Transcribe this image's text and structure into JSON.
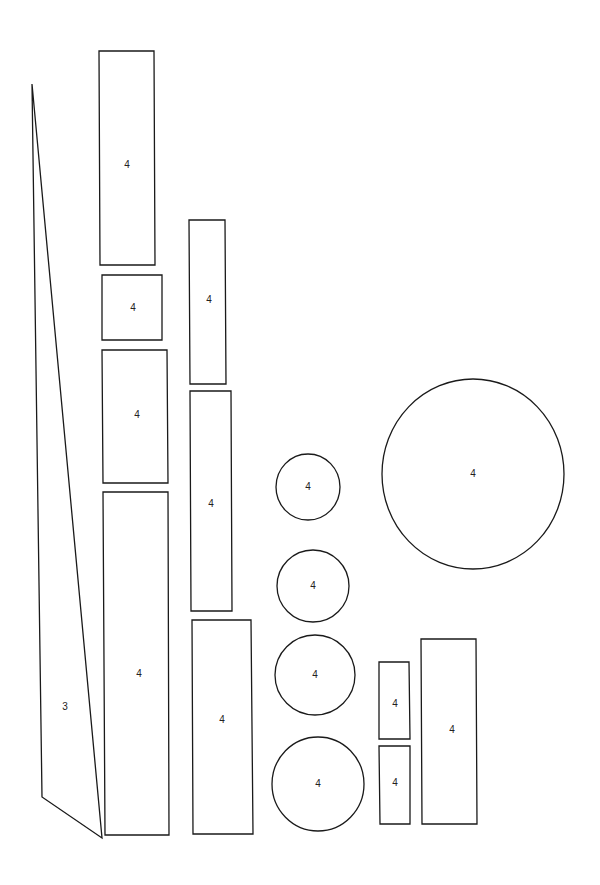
{
  "canvas": {
    "width": 600,
    "height": 885,
    "background": "#ffffff",
    "stroke": "#1a1a1a"
  },
  "shapes": [
    {
      "type": "triangle",
      "label": "3",
      "points": "32,84 102,838 42,797",
      "label_x": 65,
      "label_y": 707
    },
    {
      "type": "rect",
      "label": "4",
      "points": "99,51 154,51 155,265 100,265",
      "label_x": 127,
      "label_y": 165
    },
    {
      "type": "rect",
      "label": "4",
      "points": "102,275 162,275 162,340 102,340",
      "label_x": 133,
      "label_y": 308
    },
    {
      "type": "rect",
      "label": "4",
      "points": "102,350 167,350 168,483 103,483",
      "label_x": 137,
      "label_y": 415
    },
    {
      "type": "rect",
      "label": "4",
      "points": "103,492 168,492 169,835 105,835",
      "label_x": 139,
      "label_y": 674
    },
    {
      "type": "rect",
      "label": "4",
      "points": "189,220 225,220 226,384 190,384",
      "label_x": 209,
      "label_y": 300
    },
    {
      "type": "rect",
      "label": "4",
      "points": "190,391 231,391 232,611 191,611",
      "label_x": 211,
      "label_y": 504
    },
    {
      "type": "rect",
      "label": "4",
      "points": "192,620 251,620 253,834 193,834",
      "label_x": 222,
      "label_y": 720
    },
    {
      "type": "circle",
      "label": "4",
      "cx": 308,
      "cy": 487,
      "rx": 32,
      "ry": 33
    },
    {
      "type": "circle",
      "label": "4",
      "cx": 313,
      "cy": 586,
      "rx": 36,
      "ry": 36
    },
    {
      "type": "circle",
      "label": "4",
      "cx": 315,
      "cy": 675,
      "rx": 40,
      "ry": 40
    },
    {
      "type": "circle",
      "label": "4",
      "cx": 318,
      "cy": 784,
      "rx": 46,
      "ry": 47
    },
    {
      "type": "circle",
      "label": "4",
      "cx": 473,
      "cy": 474,
      "rx": 91,
      "ry": 95
    },
    {
      "type": "rect",
      "label": "4",
      "points": "379,662 409,662 410,739 379,739",
      "label_x": 395,
      "label_y": 704
    },
    {
      "type": "rect",
      "label": "4",
      "points": "379,746 410,746 410,824 380,824",
      "label_x": 395,
      "label_y": 783
    },
    {
      "type": "rect",
      "label": "4",
      "points": "421,639 476,639 477,824 422,824",
      "label_x": 452,
      "label_y": 730
    }
  ]
}
